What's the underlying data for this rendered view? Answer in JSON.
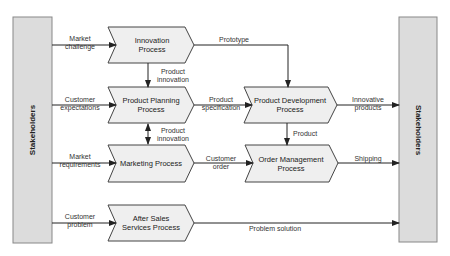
{
  "stakeholders": {
    "left": "Stakeholders",
    "right": "Stakeholders"
  },
  "processes": {
    "innovation": "Innovation Process",
    "product_planning": "Product Planning Process",
    "marketing": "Marketing Process",
    "after_sales": "After Sales Services Process",
    "product_development": "Product Development Process",
    "order_management": "Order Management Process"
  },
  "process_lines": {
    "innovation": [
      "Innovation",
      "Process"
    ],
    "product_planning": [
      "Product Planning",
      "Process"
    ],
    "marketing": [
      "Marketing Process"
    ],
    "after_sales": [
      "After Sales",
      "Services Process"
    ],
    "product_development": [
      "Product Development",
      "Process"
    ],
    "order_management": [
      "Order Management",
      "Process"
    ]
  },
  "flows": {
    "market_challenge": [
      "Market",
      "challenge"
    ],
    "customer_expectations": [
      "Customer",
      "expectations"
    ],
    "market_requirements": [
      "Market",
      "requirements"
    ],
    "customer_problem": [
      "Customer",
      "problem"
    ],
    "prototype": "Prototype",
    "product_innovation_1": [
      "Product",
      "innovation"
    ],
    "product_innovation_2": [
      "Product",
      "innovation"
    ],
    "product_specification": [
      "Product",
      "specification"
    ],
    "customer_order": [
      "Customer",
      "order"
    ],
    "product": "Product",
    "innovative_products": [
      "Innovative",
      "products"
    ],
    "shipping": "Shipping",
    "problem_solution": "Problem solution"
  },
  "colors": {
    "stakeholder_fill": "#dcdcdc",
    "process_fill": "#efefef",
    "stroke": "#444444"
  }
}
